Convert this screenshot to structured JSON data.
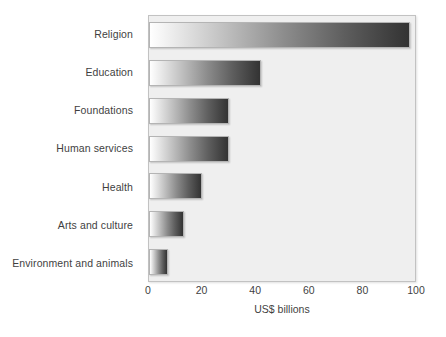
{
  "chart_data": {
    "type": "bar",
    "orientation": "horizontal",
    "title": "",
    "xlabel": "US$ billions",
    "ylabel": "",
    "categories": [
      "Religion",
      "Education",
      "Foundations",
      "Human services",
      "Health",
      "Arts and culture",
      "Environment and animals"
    ],
    "values": [
      98,
      42,
      30,
      30,
      20,
      13,
      7
    ],
    "xlim": [
      0,
      100
    ],
    "xticks": [
      0,
      20,
      40,
      60,
      80,
      100
    ],
    "xtick_labels": [
      "0",
      "20",
      "40",
      "60",
      "80",
      "100"
    ],
    "grid": false,
    "legend": false,
    "bar_gradient_start": "#ffffff",
    "bar_gradient_end": "#333333",
    "plot_background": "#efefef",
    "plot_border": "#c2c2c2",
    "text_color": "#3f3f3f"
  }
}
